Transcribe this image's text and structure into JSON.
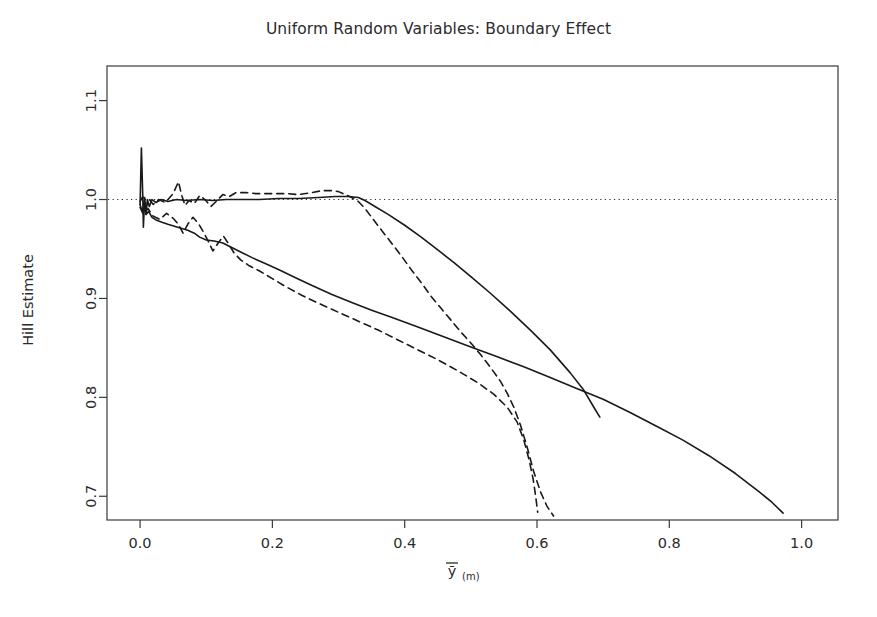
{
  "chart_data": {
    "type": "line",
    "title": "Uniform Random Variables: Boundary Effect",
    "xlabel": "ȳ(m)",
    "xlabel_base": "ȳ",
    "xlabel_sub": "(m)",
    "ylabel": "Hill Estimate",
    "xlim": [
      -0.05,
      1.055
    ],
    "ylim": [
      0.676,
      1.135
    ],
    "xticks": [
      0.0,
      0.2,
      0.4,
      0.6,
      0.8,
      1.0
    ],
    "xtick_labels": [
      "0.0",
      "0.2",
      "0.4",
      "0.6",
      "0.8",
      "1.0"
    ],
    "yticks": [
      0.7,
      0.8,
      0.9,
      1.0,
      1.1
    ],
    "ytick_labels": [
      "0.7",
      "0.8",
      "0.9",
      "1.0",
      "1.1"
    ],
    "grid": false,
    "legend": "none",
    "line_color": "#1a1a1a",
    "reference_line": {
      "name": "unit-reference",
      "orientation": "horizontal",
      "y": 1.0,
      "style": "dotted",
      "color": "#2b2b2b"
    },
    "series": [
      {
        "name": "solid-upper",
        "style": "solid",
        "color": "#1a1a1a",
        "points": [
          [
            0.0,
            0.995
          ],
          [
            0.002,
            1.052
          ],
          [
            0.004,
            1.005
          ],
          [
            0.005,
            0.972
          ],
          [
            0.007,
            1.002
          ],
          [
            0.009,
            0.985
          ],
          [
            0.011,
            1.0
          ],
          [
            0.014,
            0.993
          ],
          [
            0.018,
            1.0
          ],
          [
            0.024,
            0.997
          ],
          [
            0.032,
            1.0
          ],
          [
            0.042,
            0.998
          ],
          [
            0.055,
            1.0
          ],
          [
            0.07,
            0.999
          ],
          [
            0.09,
            1.0
          ],
          [
            0.11,
            0.999
          ],
          [
            0.13,
            1.0
          ],
          [
            0.155,
            1.0
          ],
          [
            0.18,
            1.0
          ],
          [
            0.21,
            1.001
          ],
          [
            0.24,
            1.001
          ],
          [
            0.27,
            1.002
          ],
          [
            0.295,
            1.003
          ],
          [
            0.315,
            1.003
          ],
          [
            0.33,
            1.002
          ],
          [
            0.34,
            0.999
          ],
          [
            0.355,
            0.993
          ],
          [
            0.375,
            0.985
          ],
          [
            0.4,
            0.974
          ],
          [
            0.425,
            0.962
          ],
          [
            0.45,
            0.949
          ],
          [
            0.475,
            0.936
          ],
          [
            0.5,
            0.922
          ],
          [
            0.53,
            0.905
          ],
          [
            0.56,
            0.887
          ],
          [
            0.59,
            0.868
          ],
          [
            0.62,
            0.848
          ],
          [
            0.65,
            0.825
          ],
          [
            0.67,
            0.808
          ],
          [
            0.685,
            0.791
          ],
          [
            0.695,
            0.78
          ]
        ]
      },
      {
        "name": "solid-lower",
        "style": "solid",
        "color": "#1a1a1a",
        "points": [
          [
            0.0,
            0.995
          ],
          [
            0.003,
            0.988
          ],
          [
            0.006,
            0.994
          ],
          [
            0.009,
            0.985
          ],
          [
            0.013,
            0.988
          ],
          [
            0.018,
            0.982
          ],
          [
            0.025,
            0.979
          ],
          [
            0.033,
            0.977
          ],
          [
            0.042,
            0.975
          ],
          [
            0.052,
            0.973
          ],
          [
            0.062,
            0.971
          ],
          [
            0.072,
            0.969
          ],
          [
            0.082,
            0.966
          ],
          [
            0.09,
            0.962
          ],
          [
            0.1,
            0.959
          ],
          [
            0.112,
            0.958
          ],
          [
            0.125,
            0.956
          ],
          [
            0.14,
            0.951
          ],
          [
            0.155,
            0.946
          ],
          [
            0.17,
            0.941
          ],
          [
            0.19,
            0.935
          ],
          [
            0.21,
            0.929
          ],
          [
            0.235,
            0.921
          ],
          [
            0.26,
            0.913
          ],
          [
            0.29,
            0.904
          ],
          [
            0.32,
            0.896
          ],
          [
            0.35,
            0.888
          ],
          [
            0.38,
            0.881
          ],
          [
            0.42,
            0.871
          ],
          [
            0.46,
            0.861
          ],
          [
            0.5,
            0.851
          ],
          [
            0.54,
            0.841
          ],
          [
            0.58,
            0.831
          ],
          [
            0.62,
            0.82
          ],
          [
            0.66,
            0.809
          ],
          [
            0.7,
            0.798
          ],
          [
            0.74,
            0.785
          ],
          [
            0.78,
            0.771
          ],
          [
            0.82,
            0.757
          ],
          [
            0.86,
            0.741
          ],
          [
            0.9,
            0.723
          ],
          [
            0.935,
            0.705
          ],
          [
            0.955,
            0.694
          ],
          [
            0.972,
            0.683
          ]
        ]
      },
      {
        "name": "dashed-upper",
        "style": "dashed",
        "color": "#1a1a1a",
        "points": [
          [
            0.0,
            0.998
          ],
          [
            0.004,
            1.003
          ],
          [
            0.009,
            0.993
          ],
          [
            0.014,
            1.0
          ],
          [
            0.02,
            0.995
          ],
          [
            0.028,
            1.0
          ],
          [
            0.038,
            0.997
          ],
          [
            0.05,
            1.006
          ],
          [
            0.058,
            1.018
          ],
          [
            0.063,
            1.004
          ],
          [
            0.068,
            0.994
          ],
          [
            0.074,
            0.999
          ],
          [
            0.082,
            0.996
          ],
          [
            0.09,
            1.004
          ],
          [
            0.098,
            1.0
          ],
          [
            0.107,
            0.993
          ],
          [
            0.115,
            0.998
          ],
          [
            0.125,
            1.005
          ],
          [
            0.135,
            1.003
          ],
          [
            0.145,
            1.007
          ],
          [
            0.16,
            1.007
          ],
          [
            0.175,
            1.006
          ],
          [
            0.19,
            1.006
          ],
          [
            0.205,
            1.006
          ],
          [
            0.22,
            1.006
          ],
          [
            0.24,
            1.005
          ],
          [
            0.26,
            1.007
          ],
          [
            0.275,
            1.009
          ],
          [
            0.29,
            1.009
          ],
          [
            0.3,
            1.008
          ],
          [
            0.31,
            1.005
          ],
          [
            0.32,
            1.002
          ],
          [
            0.33,
            0.998
          ],
          [
            0.34,
            0.991
          ],
          [
            0.35,
            0.982
          ],
          [
            0.365,
            0.969
          ],
          [
            0.38,
            0.956
          ],
          [
            0.395,
            0.943
          ],
          [
            0.41,
            0.929
          ],
          [
            0.425,
            0.916
          ],
          [
            0.44,
            0.902
          ],
          [
            0.455,
            0.89
          ],
          [
            0.47,
            0.878
          ],
          [
            0.485,
            0.866
          ],
          [
            0.5,
            0.855
          ],
          [
            0.515,
            0.843
          ],
          [
            0.53,
            0.83
          ],
          [
            0.545,
            0.816
          ],
          [
            0.555,
            0.804
          ],
          [
            0.565,
            0.79
          ],
          [
            0.575,
            0.772
          ],
          [
            0.585,
            0.75
          ],
          [
            0.595,
            0.725
          ],
          [
            0.605,
            0.705
          ],
          [
            0.615,
            0.69
          ],
          [
            0.625,
            0.68
          ]
        ]
      },
      {
        "name": "dashed-lower",
        "style": "dashed",
        "color": "#1a1a1a",
        "points": [
          [
            0.0,
            0.992
          ],
          [
            0.005,
            0.985
          ],
          [
            0.012,
            0.991
          ],
          [
            0.02,
            0.983
          ],
          [
            0.03,
            0.98
          ],
          [
            0.04,
            0.986
          ],
          [
            0.05,
            0.981
          ],
          [
            0.058,
            0.975
          ],
          [
            0.065,
            0.966
          ],
          [
            0.072,
            0.975
          ],
          [
            0.08,
            0.982
          ],
          [
            0.088,
            0.976
          ],
          [
            0.095,
            0.968
          ],
          [
            0.103,
            0.958
          ],
          [
            0.11,
            0.948
          ],
          [
            0.118,
            0.956
          ],
          [
            0.126,
            0.963
          ],
          [
            0.134,
            0.955
          ],
          [
            0.142,
            0.946
          ],
          [
            0.152,
            0.939
          ],
          [
            0.165,
            0.933
          ],
          [
            0.18,
            0.928
          ],
          [
            0.2,
            0.92
          ],
          [
            0.22,
            0.912
          ],
          [
            0.245,
            0.903
          ],
          [
            0.27,
            0.895
          ],
          [
            0.3,
            0.886
          ],
          [
            0.33,
            0.877
          ],
          [
            0.36,
            0.868
          ],
          [
            0.39,
            0.858
          ],
          [
            0.42,
            0.848
          ],
          [
            0.45,
            0.838
          ],
          [
            0.48,
            0.827
          ],
          [
            0.51,
            0.815
          ],
          [
            0.535,
            0.803
          ],
          [
            0.555,
            0.79
          ],
          [
            0.57,
            0.775
          ],
          [
            0.58,
            0.757
          ],
          [
            0.588,
            0.737
          ],
          [
            0.594,
            0.718
          ],
          [
            0.598,
            0.7
          ],
          [
            0.601,
            0.684
          ]
        ]
      }
    ]
  }
}
